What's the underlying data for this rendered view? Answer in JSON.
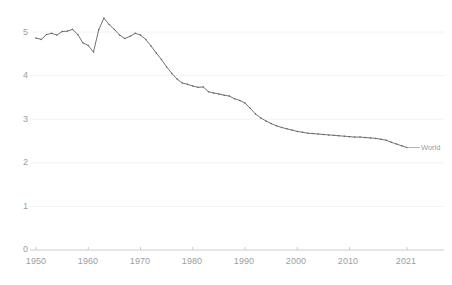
{
  "chart_data": {
    "type": "line",
    "title": "",
    "subtitle": "",
    "xlabel": "",
    "ylabel": "",
    "xlim": [
      1948,
      2023
    ],
    "ylim": [
      0,
      5.6
    ],
    "grid": "faint-horizontal",
    "legend_position": "end-of-line",
    "x_ticks": [
      "1950",
      "1960",
      "1970",
      "1980",
      "1990",
      "2000",
      "2010",
      "2021"
    ],
    "x_tick_values": [
      1950,
      1960,
      1970,
      1980,
      1990,
      2000,
      2010,
      2021
    ],
    "y_ticks": [
      "0",
      "1",
      "2",
      "3",
      "4",
      "5"
    ],
    "y_tick_values": [
      0,
      1,
      2,
      3,
      4,
      5
    ],
    "line_color": "#5f6368",
    "series": [
      {
        "name": "World",
        "label": "World",
        "color": "#5f6368",
        "x": [
          1950,
          1951,
          1952,
          1953,
          1954,
          1955,
          1956,
          1957,
          1958,
          1959,
          1960,
          1961,
          1962,
          1963,
          1964,
          1965,
          1966,
          1967,
          1968,
          1969,
          1970,
          1971,
          1972,
          1973,
          1974,
          1975,
          1976,
          1977,
          1978,
          1979,
          1980,
          1981,
          1982,
          1983,
          1984,
          1985,
          1986,
          1987,
          1988,
          1989,
          1990,
          1991,
          1992,
          1993,
          1994,
          1995,
          1996,
          1997,
          1998,
          1999,
          2000,
          2001,
          2002,
          2003,
          2004,
          2005,
          2006,
          2007,
          2008,
          2009,
          2010,
          2011,
          2012,
          2013,
          2014,
          2015,
          2016,
          2017,
          2018,
          2019,
          2020,
          2021
        ],
        "values": [
          4.86,
          4.83,
          4.94,
          4.97,
          4.93,
          5.01,
          5.02,
          5.06,
          4.94,
          4.75,
          4.69,
          4.54,
          5.05,
          5.32,
          5.17,
          5.06,
          4.93,
          4.85,
          4.9,
          4.97,
          4.93,
          4.83,
          4.68,
          4.52,
          4.37,
          4.2,
          4.05,
          3.92,
          3.83,
          3.8,
          3.76,
          3.73,
          3.74,
          3.63,
          3.6,
          3.58,
          3.55,
          3.53,
          3.47,
          3.43,
          3.37,
          3.25,
          3.12,
          3.03,
          2.96,
          2.9,
          2.85,
          2.81,
          2.78,
          2.75,
          2.72,
          2.7,
          2.68,
          2.67,
          2.66,
          2.65,
          2.64,
          2.63,
          2.62,
          2.61,
          2.6,
          2.59,
          2.59,
          2.58,
          2.57,
          2.56,
          2.54,
          2.52,
          2.47,
          2.43,
          2.39,
          2.35
        ]
      }
    ]
  },
  "axis": {
    "y_labels": [
      "5",
      "4",
      "3",
      "2",
      "1",
      "0"
    ],
    "x_labels": [
      "1950",
      "1960",
      "1970",
      "1980",
      "1990",
      "2000",
      "2010",
      "2021"
    ]
  },
  "annotations": {
    "series_end_label": "World"
  }
}
